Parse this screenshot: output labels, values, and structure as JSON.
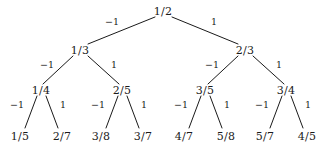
{
  "figure": {
    "type": "binary-fraction-tree",
    "background_color": "#ffffff",
    "stroke_color": "#1a1a1a",
    "text_color": "#1a1a1a"
  },
  "nodes": {
    "root": {
      "label": "1/2",
      "x": 163,
      "y": 11
    },
    "level1": [
      {
        "label": "1/3",
        "x": 80,
        "y": 50
      },
      {
        "label": "2/3",
        "x": 245,
        "y": 50
      }
    ],
    "level2": [
      {
        "label": "1/4",
        "x": 41,
        "y": 90
      },
      {
        "label": "2/5",
        "x": 122,
        "y": 90
      },
      {
        "label": "3/5",
        "x": 205,
        "y": 90
      },
      {
        "label": "3/4",
        "x": 286,
        "y": 90
      }
    ],
    "leaves": [
      {
        "label": "1/5",
        "x": 20,
        "y": 136
      },
      {
        "label": "2/7",
        "x": 62,
        "y": 136
      },
      {
        "label": "3/8",
        "x": 101,
        "y": 136
      },
      {
        "label": "3/7",
        "x": 143,
        "y": 136
      },
      {
        "label": "4/7",
        "x": 184,
        "y": 136
      },
      {
        "label": "5/8",
        "x": 226,
        "y": 136
      },
      {
        "label": "5/7",
        "x": 265,
        "y": 136
      },
      {
        "label": "4/5",
        "x": 307,
        "y": 136
      }
    ]
  },
  "edges": [
    {
      "from": "1/2",
      "to": "1/3",
      "label": "−1",
      "x1": 155,
      "y1": 17,
      "x2": 88,
      "y2": 44,
      "lx": 112,
      "ly": 22
    },
    {
      "from": "1/2",
      "to": "2/3",
      "label": "1",
      "x1": 172,
      "y1": 17,
      "x2": 238,
      "y2": 44,
      "lx": 214,
      "ly": 22
    },
    {
      "from": "1/3",
      "to": "1/4",
      "label": "−1",
      "x1": 73,
      "y1": 56,
      "x2": 43,
      "y2": 84,
      "lx": 47,
      "ly": 65
    },
    {
      "from": "1/3",
      "to": "2/5",
      "label": "1",
      "x1": 88,
      "y1": 56,
      "x2": 119,
      "y2": 84,
      "lx": 114,
      "ly": 65
    },
    {
      "from": "2/3",
      "to": "3/5",
      "label": "−1",
      "x1": 238,
      "y1": 56,
      "x2": 208,
      "y2": 84,
      "lx": 212,
      "ly": 65
    },
    {
      "from": "2/3",
      "to": "3/4",
      "label": "1",
      "x1": 253,
      "y1": 56,
      "x2": 284,
      "y2": 84,
      "lx": 279,
      "ly": 65
    },
    {
      "from": "1/4",
      "to": "1/5",
      "label": "−1",
      "x1": 37,
      "y1": 96,
      "x2": 25,
      "y2": 128,
      "lx": 17,
      "ly": 105
    },
    {
      "from": "1/4",
      "to": "2/7",
      "label": "1",
      "x1": 46,
      "y1": 96,
      "x2": 58,
      "y2": 128,
      "lx": 63,
      "ly": 105
    },
    {
      "from": "2/5",
      "to": "3/8",
      "label": "−1",
      "x1": 118,
      "y1": 96,
      "x2": 106,
      "y2": 128,
      "lx": 98,
      "ly": 105
    },
    {
      "from": "2/5",
      "to": "3/7",
      "label": "1",
      "x1": 127,
      "y1": 96,
      "x2": 139,
      "y2": 128,
      "lx": 144,
      "ly": 105
    },
    {
      "from": "3/5",
      "to": "4/7",
      "label": "−1",
      "x1": 201,
      "y1": 96,
      "x2": 189,
      "y2": 128,
      "lx": 181,
      "ly": 105
    },
    {
      "from": "3/5",
      "to": "5/8",
      "label": "1",
      "x1": 210,
      "y1": 96,
      "x2": 222,
      "y2": 128,
      "lx": 227,
      "ly": 105
    },
    {
      "from": "3/4",
      "to": "5/7",
      "label": "−1",
      "x1": 282,
      "y1": 96,
      "x2": 270,
      "y2": 128,
      "lx": 262,
      "ly": 105
    },
    {
      "from": "3/4",
      "to": "4/5",
      "label": "1",
      "x1": 291,
      "y1": 96,
      "x2": 303,
      "y2": 128,
      "lx": 308,
      "ly": 105
    }
  ]
}
